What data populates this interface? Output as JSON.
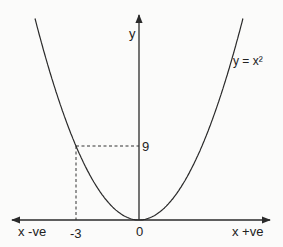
{
  "chart_data": {
    "type": "line",
    "title": "",
    "function": "y = x^2",
    "curve_label": "y = x²",
    "xlabel_negative": "x -ve",
    "xlabel_positive": "x +ve",
    "ylabel": "y",
    "x_ticks": [
      "-3",
      "0"
    ],
    "y_ticks": [
      "9"
    ],
    "highlighted_point": {
      "x": -3,
      "y": 9
    },
    "series": [
      {
        "name": "y = x²",
        "x": [
          -3,
          -2,
          -1,
          0,
          1,
          2,
          3
        ],
        "y": [
          9,
          4,
          1,
          0,
          1,
          4,
          9
        ]
      }
    ],
    "grid": false,
    "legend": false
  },
  "labels": {
    "y_axis": "y",
    "curve": "y = x²",
    "nine": "9",
    "minus_three": "-3",
    "origin": "0",
    "x_neg": "x -ve",
    "x_pos": "x +ve"
  },
  "colors": {
    "line": "#2a2a2a",
    "background": "#fbfbfa"
  }
}
